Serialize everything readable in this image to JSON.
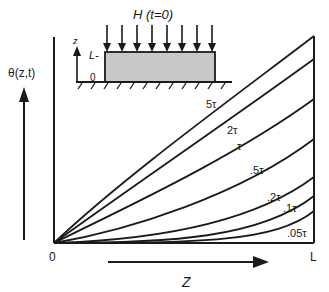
{
  "inset": {
    "title": "H (t=0)",
    "z_axis_label": "z",
    "top_label": "L-",
    "bottom_label": "0",
    "arrow_count": 8,
    "box_fill": "#c8c8c8"
  },
  "axes": {
    "y_label": "θ(z,t)",
    "x_label": "Z",
    "origin_label": "0",
    "x_end_label": "L"
  },
  "curves": [
    {
      "label": "5τ",
      "end_y": 36
    },
    {
      "label": "2τ",
      "end_y": 59
    },
    {
      "label": "τ",
      "end_y": 99
    },
    {
      "label": ".5τ",
      "end_y": 139
    },
    {
      "label": ".2τ",
      "end_y": 177
    },
    {
      "label": ".1τ",
      "end_y": 196
    },
    {
      "label": ".05τ",
      "end_y": 211
    }
  ],
  "colors": {
    "line": "#1a1a1a",
    "background": "#ffffff"
  }
}
